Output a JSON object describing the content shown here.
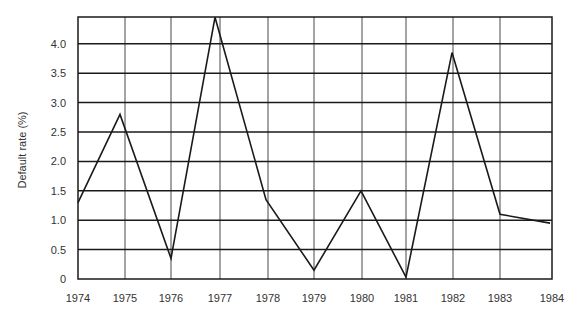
{
  "chart_data": {
    "type": "line",
    "title": "",
    "xlabel": "",
    "ylabel": "Default rate (%)",
    "categories": [
      "1974",
      "1975",
      "1976",
      "1977",
      "1978",
      "1979",
      "1980",
      "1981",
      "1982",
      "1983",
      "1984"
    ],
    "series": [
      {
        "name": "Default rate",
        "values": [
          1.3,
          2.8,
          0.35,
          4.45,
          1.35,
          0.15,
          1.5,
          0.03,
          3.85,
          1.1,
          0.95
        ]
      }
    ],
    "yticks": [
      "0",
      "0.5",
      "1.0",
      "1.5",
      "2.0",
      "2.5",
      "3.0",
      "3.5",
      "4.0"
    ],
    "ylim": [
      0,
      4.45
    ],
    "grid": true,
    "legend": "none",
    "colors": {
      "line": "#1a1a1a",
      "grid": "#1a1a1a",
      "text": "#333333"
    }
  }
}
